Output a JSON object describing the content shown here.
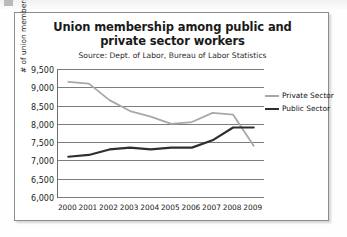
{
  "card": {
    "border_color": "#8d8d8d"
  },
  "chart_data": {
    "type": "line",
    "title": "Union membership among public and private sector workers",
    "subtitle": "Source: Dept. of Labor, Bureau of Labor Statistics",
    "xlabel": "",
    "ylabel": "# of union members (thousands)",
    "categories": [
      "2000",
      "2001",
      "2002",
      "2003",
      "2004",
      "2005",
      "2006",
      "2007",
      "2008",
      "2009"
    ],
    "ytick_labels": [
      "9,500",
      "9,000",
      "8,500",
      "8,000",
      "7,500",
      "7,000",
      "6,500",
      "6,000"
    ],
    "ytick_values": [
      9500,
      9000,
      8500,
      8000,
      7500,
      7000,
      6500,
      6000
    ],
    "ylim": [
      6000,
      9500
    ],
    "grid": true,
    "legend_position": "right",
    "series": [
      {
        "name": "Private Sector",
        "color": "#a8a8a8",
        "values": [
          9150,
          9100,
          8650,
          8350,
          8200,
          8000,
          8050,
          8300,
          8250,
          7400
        ]
      },
      {
        "name": "Public Sector",
        "color": "#2f2f2f",
        "values": [
          7100,
          7150,
          7300,
          7350,
          7300,
          7350,
          7350,
          7550,
          7900,
          7900
        ]
      }
    ]
  }
}
